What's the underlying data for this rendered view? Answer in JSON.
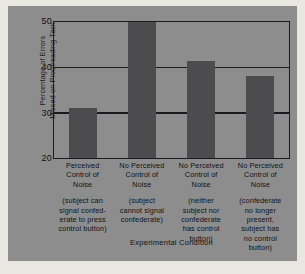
{
  "chart_data": {
    "type": "bar",
    "title": "",
    "xlabel": "Experimental Condition",
    "ylabel": "Percentage of Errors\nMissed on Proofreading Task",
    "ylim": [
      20,
      50
    ],
    "yticks": [
      20,
      30,
      40,
      50
    ],
    "ytick_labels": [
      "20",
      "30",
      "40",
      "50"
    ],
    "grid": true,
    "legend": "none",
    "categories": [
      "Perceived\nControl of\nNoise",
      "No Perceived\nControl of\nNoise",
      "No Perceived\nControl of\nNoise",
      "No Perceived\nControl of\nNoise"
    ],
    "category_sublabels": [
      "(subject can\nsignal confed-\nerate to press\ncontrol button)",
      "(subject\ncannot signal\nconfederate)",
      "(neither\nsubject nor\nconfederate\nhas control\nbutton)",
      "(confederate\nno longer\npresent,\nsubject has\nno control\nbutton)"
    ],
    "values": [
      31,
      50,
      41.5,
      38
    ],
    "bar_color": "#4c4c4e",
    "plot_background": "#8d8d8d",
    "axis_color": "#1b1b1e"
  },
  "axes": {
    "y_title": "Percentage of Errors\nMissed on Proofreading Task",
    "x_title": "Experimental Condition",
    "ytick_0": "20",
    "ytick_1": "30",
    "ytick_2": "40",
    "ytick_3": "50"
  },
  "bars": [
    {
      "head": "Perceived\nControl of\nNoise",
      "sub": "(subject can\nsignal confed-\nerate to press\ncontrol button)",
      "value": 31
    },
    {
      "head": "No Perceived\nControl of\nNoise",
      "sub": "(subject\ncannot signal\nconfederate)",
      "value": 50
    },
    {
      "head": "No Perceived\nControl of\nNoise",
      "sub": "(neither\nsubject nor\nconfederate\nhas control\nbutton)",
      "value": 41.5
    },
    {
      "head": "No Perceived\nControl of\nNoise",
      "sub": "(confederate\nno longer\npresent,\nsubject has\nno control\nbutton)",
      "value": 38
    }
  ]
}
